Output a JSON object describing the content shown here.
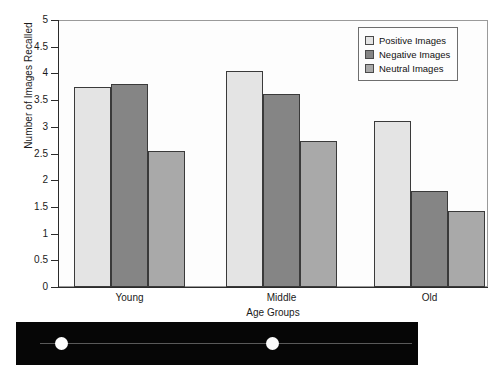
{
  "chart_data": {
    "type": "bar",
    "title": "",
    "xlabel": "Age Groups",
    "ylabel": "Number of Images Recalled",
    "categories": [
      "Young",
      "Middle",
      "Old"
    ],
    "series": [
      {
        "name": "Positive Images",
        "color": "#e4e4e4",
        "values": [
          3.75,
          4.05,
          3.1
        ]
      },
      {
        "name": "Negative Images",
        "color": "#858585",
        "values": [
          3.8,
          3.62,
          1.8
        ]
      },
      {
        "name": "Neutral Images",
        "color": "#a9a9a9",
        "values": [
          2.55,
          2.74,
          1.43
        ]
      }
    ],
    "ylim": [
      0,
      5
    ],
    "yticks": [
      0,
      0.5,
      1,
      1.5,
      2,
      2.5,
      3,
      3.5,
      4,
      4.5,
      5
    ],
    "ytick_labels": [
      "0",
      "0.5",
      "1",
      "1.5",
      "2",
      "2.5",
      "3",
      "3.5",
      "4",
      "4.5",
      "5"
    ],
    "grid": false,
    "legend_position": "top-right"
  },
  "legend": {
    "entries": [
      {
        "label": "Positive Images",
        "swatch": "positive"
      },
      {
        "label": "Negative Images",
        "swatch": "negative"
      },
      {
        "label": "Neutral Images",
        "swatch": "neutral"
      }
    ]
  },
  "photo_strip": {
    "background": "#060606",
    "dots": [
      {
        "x": 39,
        "color": "#fdfdfd"
      },
      {
        "x": 250,
        "color": "#fbfbfb"
      },
      {
        "x": 410,
        "color": "#bdbdbd"
      }
    ]
  }
}
